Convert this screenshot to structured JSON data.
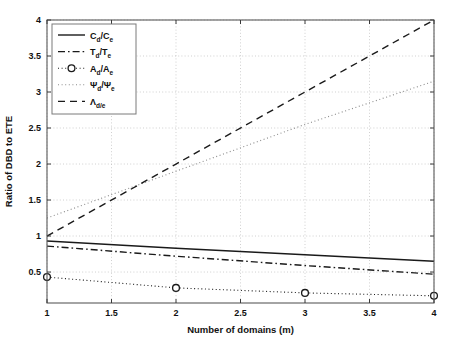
{
  "chart_data": {
    "type": "line",
    "title": "",
    "xlabel": "Number of domains (m)",
    "ylabel": "Ratio of DBD to ETE",
    "xlim": [
      1,
      4
    ],
    "ylim": [
      0.07,
      4
    ],
    "xticks": [
      "1",
      "1.5",
      "2",
      "2.5",
      "3",
      "3.5",
      "4"
    ],
    "xtick_values": [
      1,
      1.5,
      2,
      2.5,
      3,
      3.5,
      4
    ],
    "yticks": [
      "0.5",
      "1",
      "1.5",
      "2",
      "2.5",
      "3",
      "3.5",
      "4"
    ],
    "ytick_values": [
      0.5,
      1,
      1.5,
      2,
      2.5,
      3,
      3.5,
      4
    ],
    "grid": true,
    "grid_style": "dotted",
    "legend_position": "top-left",
    "x": [
      1,
      2,
      3,
      4
    ],
    "series": [
      {
        "name": "C_d/C_e",
        "label_main": "C",
        "label_sub1": "d",
        "label_slash": "/C",
        "label_sub2": "e",
        "style": "solid",
        "marker": "none",
        "color": "#1a1a1a",
        "values": [
          0.93,
          0.83,
          0.74,
          0.65
        ]
      },
      {
        "name": "T_d/T_e",
        "label_main": "T",
        "label_sub1": "d",
        "label_slash": "/T",
        "label_sub2": "e",
        "style": "dashdot",
        "marker": "none",
        "color": "#1a1a1a",
        "values": [
          0.86,
          0.72,
          0.59,
          0.47
        ]
      },
      {
        "name": "A_d/A_e",
        "label_main": "A",
        "label_sub1": "d",
        "label_slash": "/A",
        "label_sub2": "e",
        "style": "dotted",
        "marker": "circle",
        "color": "#1a1a1a",
        "values": [
          0.43,
          0.28,
          0.21,
          0.17
        ]
      },
      {
        "name": "Psi_d/Psi_e",
        "label_main": "Ψ",
        "label_sub1": "d",
        "label_slash": "/Ψ",
        "label_sub2": "e",
        "style": "dotted",
        "marker": "none",
        "color": "#8a8a8a",
        "values": [
          1.25,
          1.9,
          2.55,
          3.15
        ]
      },
      {
        "name": "Lambda_d/e",
        "label_main": "Λ",
        "label_sub1": "d/e",
        "label_slash": "",
        "label_sub2": "",
        "style": "dashed",
        "marker": "none",
        "color": "#1a1a1a",
        "values": [
          1.0,
          2.0,
          3.0,
          4.0
        ]
      }
    ]
  }
}
